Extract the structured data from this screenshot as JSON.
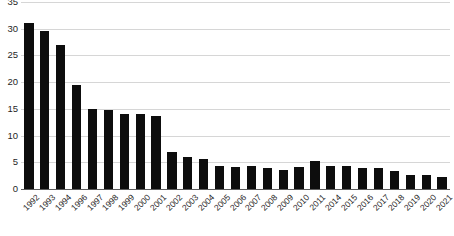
{
  "chart_data": {
    "type": "bar",
    "title": "",
    "subtitle": "",
    "xlabel": "",
    "ylabel": "",
    "grid": true,
    "legend": "none",
    "bar_color": "#0d0d0d",
    "gridline_color": "#d6d6d6",
    "axis_color": "#5c5c5c",
    "ylim": [
      0,
      35
    ],
    "yticks": [
      0,
      5,
      10,
      15,
      20,
      25,
      30,
      35
    ],
    "ytick_labels": [
      "0",
      "5",
      "10",
      "15",
      "20",
      "25",
      "30",
      "35"
    ],
    "categories": [
      "1992",
      "1993",
      "1994",
      "1996",
      "1997",
      "1998",
      "1999",
      "2000",
      "2001",
      "2002",
      "2003",
      "2004",
      "2005",
      "2006",
      "2007",
      "2008",
      "2009",
      "2010",
      "2011",
      "2014",
      "2015",
      "2016",
      "2017",
      "2018",
      "2019",
      "2020",
      "2021"
    ],
    "values": [
      31.0,
      29.5,
      27.0,
      19.4,
      15.0,
      14.8,
      14.0,
      14.0,
      13.7,
      7.0,
      6.0,
      5.6,
      4.4,
      4.2,
      4.4,
      4.0,
      3.6,
      4.1,
      5.3,
      4.4,
      4.3,
      3.9,
      3.9,
      3.4,
      2.6,
      2.6,
      2.2
    ]
  }
}
